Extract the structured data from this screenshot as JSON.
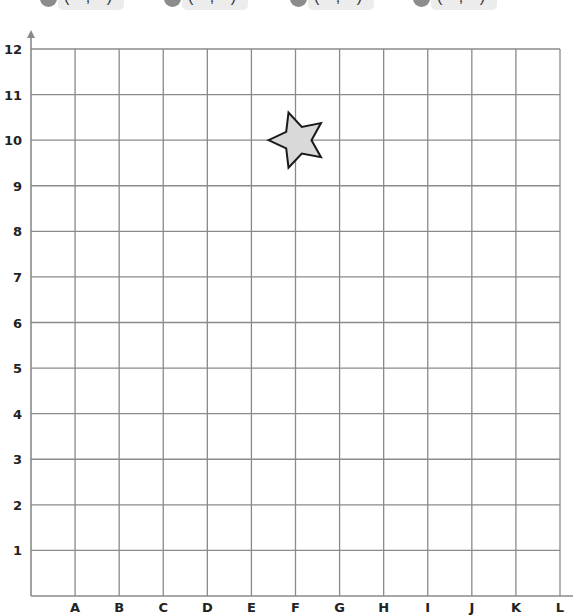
{
  "answer_slots": [
    {
      "text": "( , )"
    },
    {
      "text": "( , )"
    },
    {
      "text": "( , )"
    },
    {
      "text": "( , )"
    }
  ],
  "grid": {
    "x_labels": [
      "A",
      "B",
      "C",
      "D",
      "E",
      "F",
      "G",
      "H",
      "I",
      "J",
      "K",
      "L"
    ],
    "y_labels": [
      "1",
      "2",
      "3",
      "4",
      "5",
      "6",
      "7",
      "8",
      "9",
      "10",
      "11",
      "12"
    ],
    "x_range": [
      0,
      12
    ],
    "y_range": [
      0,
      12
    ]
  },
  "shapes": [
    {
      "type": "star",
      "name": "star",
      "center_col": "F",
      "center_row": 10,
      "fill": "#d9d9d9",
      "stroke": "#1a1a1a"
    }
  ]
}
